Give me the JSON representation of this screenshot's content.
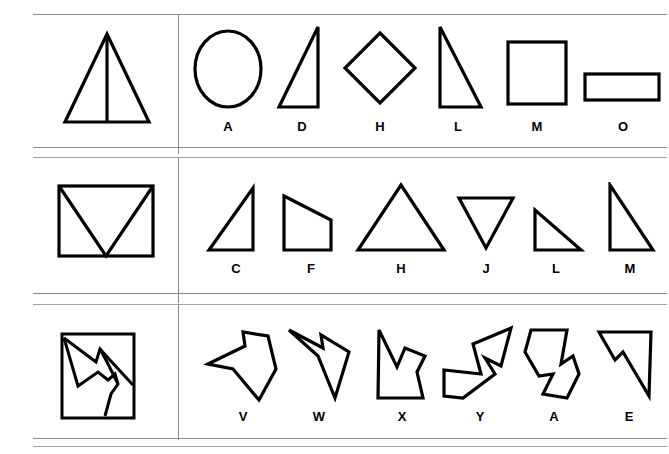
{
  "sheet": {
    "title": "Shape matching test sheet",
    "background_color": "#ffffff",
    "ink_color": "#000000",
    "rule_color": "#8d8d8d",
    "rows_count": 3,
    "options_per_row": 6
  },
  "rows": [
    {
      "id": "row-1",
      "prompt": {
        "name": "triangle-with-median-line",
        "description": "Tall isosceles triangle with a vertical line from apex to base midpoint"
      },
      "options": [
        {
          "letter": "A",
          "shape": "circle"
        },
        {
          "letter": "D",
          "shape": "narrow-right-triangle"
        },
        {
          "letter": "H",
          "shape": "diamond"
        },
        {
          "letter": "L",
          "shape": "right-triangle-left-vertical"
        },
        {
          "letter": "M",
          "shape": "square"
        },
        {
          "letter": "O",
          "shape": "wide-rectangle"
        }
      ]
    },
    {
      "id": "row-2",
      "prompt": {
        "name": "rectangle-with-v-diagonals",
        "description": "Rectangle with two diagonals from the top corners meeting at the bottom middle"
      },
      "options": [
        {
          "letter": "C",
          "shape": "right-triangle-right-vertical"
        },
        {
          "letter": "F",
          "shape": "right-trapezoid"
        },
        {
          "letter": "H",
          "shape": "wide-isosceles-triangle"
        },
        {
          "letter": "J",
          "shape": "inverted-triangle"
        },
        {
          "letter": "L",
          "shape": "small-right-triangle-left-vertical"
        },
        {
          "letter": "M",
          "shape": "right-triangle-left-vertical-tall"
        }
      ]
    },
    {
      "id": "row-3",
      "prompt": {
        "name": "square-with-zigzag-polygon",
        "description": "Square containing an irregular zigzag polygon"
      },
      "options": [
        {
          "letter": "V",
          "shape": "irregular-polygon-v"
        },
        {
          "letter": "W",
          "shape": "irregular-polygon-w"
        },
        {
          "letter": "X",
          "shape": "irregular-polygon-x"
        },
        {
          "letter": "Y",
          "shape": "irregular-polygon-y"
        },
        {
          "letter": "A",
          "shape": "irregular-polygon-a"
        },
        {
          "letter": "E",
          "shape": "irregular-polygon-e"
        }
      ]
    }
  ]
}
